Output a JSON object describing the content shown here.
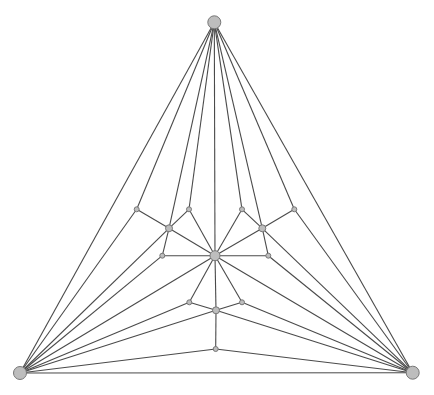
{
  "diagram": {
    "type": "planar-graph",
    "style": {
      "background": "#ffffff",
      "edge_color": "#4a4a4a",
      "node_fill": "#bdbdbd",
      "node_stroke": "#777777"
    },
    "nodes": [
      {
        "id": "top",
        "x": 214.3,
        "y": 22.3,
        "r": 6.5
      },
      {
        "id": "bottom-left",
        "x": 20,
        "y": 373,
        "r": 6.5
      },
      {
        "id": "bottom-right",
        "x": 412.7,
        "y": 372.7,
        "r": 6.5
      },
      {
        "id": "center",
        "x": 215,
        "y": 255.7,
        "r": 5
      },
      {
        "id": "A",
        "x": 136.7,
        "y": 209.3,
        "r": 2.5
      },
      {
        "id": "B",
        "x": 169,
        "y": 228.3,
        "r": 3.5
      },
      {
        "id": "C",
        "x": 189,
        "y": 209.3,
        "r": 2.5
      },
      {
        "id": "D",
        "x": 162.3,
        "y": 255.7,
        "r": 2.5
      },
      {
        "id": "A2",
        "x": 294.3,
        "y": 209.3,
        "r": 2.5
      },
      {
        "id": "B2",
        "x": 262.3,
        "y": 228.3,
        "r": 3.5
      },
      {
        "id": "C2",
        "x": 242,
        "y": 209.3,
        "r": 2.5
      },
      {
        "id": "D2",
        "x": 268.3,
        "y": 255.7,
        "r": 2.5
      },
      {
        "id": "E",
        "x": 189.3,
        "y": 302.3,
        "r": 2.5
      },
      {
        "id": "E2",
        "x": 242,
        "y": 302.3,
        "r": 2.5
      },
      {
        "id": "F",
        "x": 216,
        "y": 310.3,
        "r": 3.5
      },
      {
        "id": "G",
        "x": 215.7,
        "y": 349,
        "r": 2.5
      }
    ],
    "edges": [
      [
        "top",
        "bottom-left"
      ],
      [
        "top",
        "bottom-right"
      ],
      [
        "bottom-left",
        "bottom-right"
      ],
      [
        "top",
        "A"
      ],
      [
        "top",
        "B"
      ],
      [
        "top",
        "C"
      ],
      [
        "top",
        "center"
      ],
      [
        "top",
        "C2"
      ],
      [
        "top",
        "B2"
      ],
      [
        "top",
        "A2"
      ],
      [
        "A",
        "B"
      ],
      [
        "C",
        "B"
      ],
      [
        "C",
        "center"
      ],
      [
        "B",
        "center"
      ],
      [
        "B",
        "D"
      ],
      [
        "A",
        "bottom-left"
      ],
      [
        "B",
        "bottom-left"
      ],
      [
        "D",
        "bottom-left"
      ],
      [
        "D",
        "center"
      ],
      [
        "A2",
        "B2"
      ],
      [
        "C2",
        "B2"
      ],
      [
        "C2",
        "center"
      ],
      [
        "B2",
        "center"
      ],
      [
        "B2",
        "D2"
      ],
      [
        "A2",
        "bottom-right"
      ],
      [
        "B2",
        "bottom-right"
      ],
      [
        "D2",
        "bottom-right"
      ],
      [
        "D2",
        "center"
      ],
      [
        "center",
        "bottom-left"
      ],
      [
        "center",
        "bottom-right"
      ],
      [
        "center",
        "E"
      ],
      [
        "center",
        "E2"
      ],
      [
        "center",
        "F"
      ],
      [
        "E",
        "F"
      ],
      [
        "E2",
        "F"
      ],
      [
        "E",
        "bottom-left"
      ],
      [
        "E2",
        "bottom-right"
      ],
      [
        "F",
        "bottom-left"
      ],
      [
        "F",
        "bottom-right"
      ],
      [
        "F",
        "G"
      ],
      [
        "G",
        "bottom-left"
      ],
      [
        "G",
        "bottom-right"
      ]
    ]
  }
}
